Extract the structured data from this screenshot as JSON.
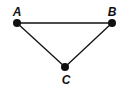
{
  "diagram": {
    "type": "triangle",
    "colors": {
      "stroke": "#111111",
      "fill": "#111111",
      "background": "#ffffff"
    },
    "points": [
      {
        "id": "A",
        "label": "A",
        "x": 17,
        "y": 23,
        "label_x": 17,
        "label_y": 15
      },
      {
        "id": "B",
        "label": "B",
        "x": 112,
        "y": 23,
        "label_x": 112,
        "label_y": 15
      },
      {
        "id": "C",
        "label": "C",
        "x": 65,
        "y": 67,
        "label_x": 66,
        "label_y": 83
      }
    ],
    "edges": [
      {
        "from": "A",
        "to": "B"
      },
      {
        "from": "A",
        "to": "C"
      },
      {
        "from": "B",
        "to": "C"
      }
    ]
  }
}
